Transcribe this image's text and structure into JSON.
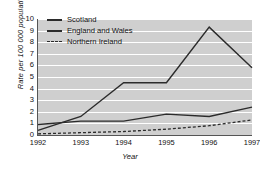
{
  "chart_data": {
    "type": "line",
    "title": "",
    "xlabel": "Year",
    "ylabel": "Rate per 100 000 population",
    "categories": [
      "1992",
      "1993",
      "1994",
      "1995",
      "1996",
      "1997"
    ],
    "x": [
      1992,
      1993,
      1994,
      1995,
      1996,
      1997
    ],
    "xlim": [
      1992,
      1997
    ],
    "ylim": [
      0,
      10
    ],
    "yticks": [
      0,
      1,
      2,
      3,
      4,
      5,
      6,
      7,
      8,
      9,
      10
    ],
    "grid": "horizontal",
    "legend_position": "top-left",
    "series": [
      {
        "name": "Scotland",
        "style": "solid",
        "color": "#2b2b2b",
        "values": [
          0.4,
          1.6,
          4.5,
          4.5,
          9.3,
          5.8
        ]
      },
      {
        "name": "England and Wales",
        "style": "solid",
        "color": "#2b2b2b",
        "values": [
          0.9,
          1.2,
          1.2,
          1.8,
          1.6,
          2.4
        ]
      },
      {
        "name": "Northern Ireland",
        "style": "dashed",
        "color": "#2b2b2b",
        "values": [
          0.1,
          0.2,
          0.3,
          0.5,
          0.8,
          1.3
        ]
      }
    ]
  },
  "axes": {
    "ylabel": "Rate per 100 000 population",
    "xlabel": "Year",
    "yticks": [
      "10",
      "9",
      "8",
      "7",
      "6",
      "5",
      "4",
      "3",
      "2",
      "1",
      "0"
    ],
    "xticks": [
      "1992",
      "1993",
      "1994",
      "1995",
      "1996",
      "1997"
    ]
  },
  "legend": {
    "items": [
      {
        "label": "Scotland",
        "style": "solid"
      },
      {
        "label": "England and Wales",
        "style": "solid"
      },
      {
        "label": "Northern Ireland",
        "style": "dashed"
      }
    ]
  },
  "colors": {
    "plot_background": "#cfcfcf",
    "gridline": "#ffffff",
    "line": "#2b2b2b",
    "axis": "#555555"
  }
}
